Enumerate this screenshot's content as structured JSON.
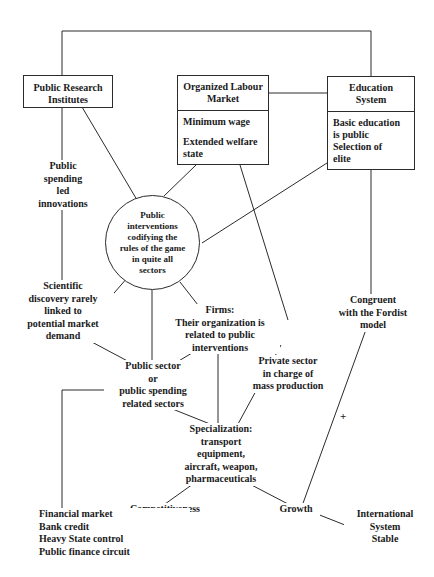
{
  "diagram": {
    "boxes": [
      {
        "id": "public-research-institutes",
        "header": "Public Research\nInstitutes",
        "body": []
      },
      {
        "id": "organized-labour-market",
        "header": "Organized Labour\nMarket",
        "body": [
          "Minimum wage",
          "Extended welfare\nstate"
        ]
      },
      {
        "id": "education-system",
        "header": "Education\nSystem",
        "body": [
          "Basic education\nis public\nSelection of\nelite"
        ]
      }
    ],
    "circle": {
      "id": "public-interventions",
      "text": "Public\ninterventions\ncodifying the\nrules of the game\nin quite all\nsectors"
    },
    "labels": [
      {
        "id": "public-spending-led-innovations",
        "text": "Public\nspending\nled\ninnovations"
      },
      {
        "id": "scientific-discovery",
        "text": "Scientific\ndiscovery rarely\nlinked to\npotential market\ndemand"
      },
      {
        "id": "firms-organization",
        "text": "Firms:\nTheir organization is\nrelated to public\ninterventions"
      },
      {
        "id": "congruent-fordist",
        "text": "Congruent\nwith the Fordist\nmodel"
      },
      {
        "id": "public-sector-or-spending",
        "text": "Public sector\nor\npublic spending\nrelated sectors"
      },
      {
        "id": "private-sector-mass-production",
        "text": "Private sector\nin charge of\nmass production"
      },
      {
        "id": "specialization",
        "text": "Specialization:\ntransport\nequipment,\naircraft, weapon,\npharmaceuticals"
      },
      {
        "id": "competitiveness",
        "text": "Competitiveness"
      },
      {
        "id": "growth",
        "text": "Growth"
      },
      {
        "id": "international-system-stable",
        "text": "International\nSystem\nStable"
      },
      {
        "id": "financial-block",
        "text": "Financial market\nBank credit\nHeavy State control\nPublic finance circuit"
      }
    ],
    "operators": [
      {
        "id": "plus-sign",
        "text": "+"
      }
    ],
    "colors": {
      "stroke": "#2b2b2b",
      "text": "#1a1a1a",
      "background": "#ffffff"
    }
  }
}
